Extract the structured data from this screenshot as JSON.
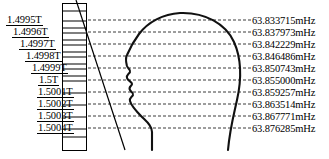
{
  "figure": {
    "width": 329,
    "height": 159,
    "background": "#ffffff",
    "line_color": "#000000",
    "dash_color": "#3a3a3a"
  },
  "gradient_box": {
    "name": "field-gradient-column",
    "x": 62,
    "y": 3,
    "width": 25,
    "height": 148,
    "bar_count": 14
  },
  "ramp": {
    "name": "gradient-ramp-line",
    "x1": 76,
    "y1": 0,
    "x2": 125,
    "y2": 150
  },
  "subject": {
    "name": "head-silhouette",
    "facing": "left"
  },
  "rows": [
    {
      "field": "1.4995T",
      "frequency": "63.833715mHz",
      "y": 20,
      "indent": 6
    },
    {
      "field": "1.4996T",
      "frequency": "63.837973mHz",
      "y": 32,
      "indent": 12
    },
    {
      "field": "1.4997T",
      "frequency": "63.842229mHz",
      "y": 44,
      "indent": 19
    },
    {
      "field": "1.4998T",
      "frequency": "63.846486mHz",
      "y": 56,
      "indent": 25
    },
    {
      "field": "1.4999T",
      "frequency": "63.850743mHz",
      "y": 68,
      "indent": 31
    },
    {
      "field": "1.5T",
      "frequency": "63.855000mHz",
      "y": 80,
      "indent": 38
    },
    {
      "field": "1.5001T",
      "frequency": "63.859257mHz",
      "y": 92,
      "indent": 37
    },
    {
      "field": "1.5002T",
      "frequency": "63.863514mHz",
      "y": 104,
      "indent": 37
    },
    {
      "field": "1.5003T",
      "frequency": "63.867771mHz",
      "y": 116,
      "indent": 37
    },
    {
      "field": "1.5004T",
      "frequency": "63.876285mHz",
      "y": 128,
      "indent": 37
    }
  ],
  "box_bars_y": [
    10,
    20,
    27,
    32,
    39,
    44,
    51,
    56,
    63,
    68,
    75,
    80,
    92,
    104,
    116,
    128,
    136
  ]
}
